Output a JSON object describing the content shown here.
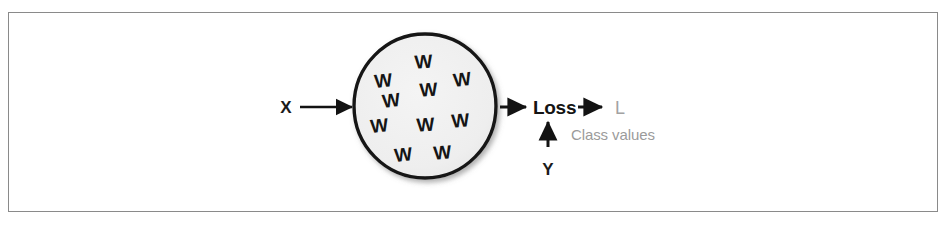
{
  "figure": {
    "type": "diagram",
    "caption": ""
  },
  "colors": {
    "frame_border": "#8a8a8a",
    "page_background": "#ffffff",
    "node_fill": "#f0f0f0",
    "node_stroke": "#161616",
    "arrow": "#131313",
    "text_dark": "#151515",
    "text_gray": "#9b9b9b"
  },
  "nodes": {
    "model": {
      "shape": "circle",
      "fill": "#f0f0f0",
      "stroke": "#161616",
      "weight_label": "W",
      "weight_count": 10,
      "weights": [
        {
          "label": "W",
          "x": 424,
          "y": 68,
          "rotate": -4
        },
        {
          "label": "W",
          "x": 384,
          "y": 87,
          "rotate": -6
        },
        {
          "label": "W",
          "x": 463,
          "y": 86,
          "rotate": -7
        },
        {
          "label": "W",
          "x": 429,
          "y": 96,
          "rotate": -4
        },
        {
          "label": "W",
          "x": 392,
          "y": 107,
          "rotate": -7
        },
        {
          "label": "W",
          "x": 461,
          "y": 127,
          "rotate": -5
        },
        {
          "label": "W",
          "x": 380,
          "y": 132,
          "rotate": -6
        },
        {
          "label": "W",
          "x": 426,
          "y": 131,
          "rotate": -4
        },
        {
          "label": "W",
          "x": 404,
          "y": 161,
          "rotate": -6
        },
        {
          "label": "W",
          "x": 443,
          "y": 159,
          "rotate": -5
        }
      ]
    },
    "loss": {
      "label": "Loss"
    }
  },
  "labels": {
    "input": "X",
    "target": "Y",
    "output": "L",
    "output_description": "Class values"
  },
  "edges": [
    {
      "name": "x-to-model",
      "from": "X",
      "to": "model",
      "direction": "right"
    },
    {
      "name": "model-to-loss",
      "from": "model",
      "to": "Loss",
      "direction": "right"
    },
    {
      "name": "loss-to-l",
      "from": "Loss",
      "to": "L",
      "direction": "right"
    },
    {
      "name": "y-to-loss",
      "from": "Y",
      "to": "Loss",
      "direction": "up"
    }
  ]
}
